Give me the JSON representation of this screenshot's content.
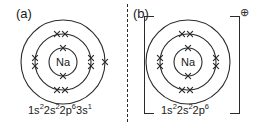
{
  "figure": {
    "width": 266,
    "height": 126,
    "background": "#ffffff",
    "stroke_color": "#2b2b2b",
    "text_color": "#1a1a1a",
    "divider_style": "vertical-dashed"
  },
  "panel_a": {
    "label": "(a)",
    "nucleus_label": "Na",
    "config_text": "1s²2s²2p⁶3s¹",
    "config_parts": [
      {
        "base": "1s",
        "sup": "2"
      },
      {
        "base": "2s",
        "sup": "2"
      },
      {
        "base": "2p",
        "sup": "6"
      },
      {
        "base": "3s",
        "sup": "1"
      }
    ],
    "shells": [
      {
        "name": "shell-1",
        "radius": 14,
        "electrons": 2
      },
      {
        "name": "shell-2",
        "radius": 28,
        "electrons": 8
      },
      {
        "name": "shell-3",
        "radius": 42,
        "electrons": 1
      }
    ],
    "electron_marker": "x",
    "total_electrons": 11,
    "has_bracket": false,
    "charge": ""
  },
  "panel_b": {
    "label": "(b)",
    "nucleus_label": "Na",
    "config_text": "1s²2s²2p⁶",
    "config_parts": [
      {
        "base": "1s",
        "sup": "2"
      },
      {
        "base": "2s",
        "sup": "2"
      },
      {
        "base": "2p",
        "sup": "6"
      }
    ],
    "shells": [
      {
        "name": "shell-1",
        "radius": 14,
        "electrons": 2
      },
      {
        "name": "shell-2",
        "radius": 28,
        "electrons": 8
      },
      {
        "name": "shell-3",
        "radius": 42,
        "electrons": 0
      }
    ],
    "electron_marker": "x",
    "total_electrons": 10,
    "has_bracket": true,
    "charge": "⊕"
  }
}
